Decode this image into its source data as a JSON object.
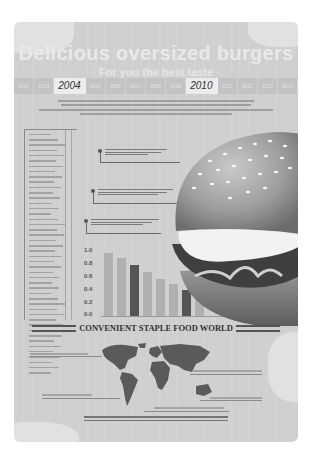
{
  "poster": {
    "title": "Delicious oversized burgers",
    "subtitle": "· For you the best taste ·",
    "timeline": {
      "years": [
        "2002",
        "2003",
        "2004",
        "2005",
        "2006",
        "2007",
        "2008",
        "2009",
        "2010",
        "2011",
        "2012",
        "2013",
        "2014"
      ],
      "highlighted": [
        "2004",
        "2010"
      ]
    },
    "intro_text": "Hamburger (Hamburger English transliteration), is a modern Western -style fast food in the world with the first vogue piece of fast food burger ...",
    "side_list_rows": 46,
    "callouts": [
      {
        "id": "callout-1",
        "text": "Hamburger caption text line"
      },
      {
        "id": "callout-2",
        "text": "Hamburger caption text line"
      },
      {
        "id": "callout-3",
        "text": "Hamburger caption text line"
      }
    ],
    "banner_title": "CONVENIENT STAPLE FOOD WORLD",
    "footer_text": "Hamburger (Hamburger English transliteration), is a modern Western -style fast food in the world with the first vogue piece of fast food burger ...",
    "colors": {
      "background": "#cfcfcf",
      "bar_light": "#b0b0b0",
      "bar_dark": "#555555",
      "banner_text": "#333333"
    }
  },
  "chart_data": {
    "type": "bar",
    "title": "",
    "xlabel": "",
    "ylabel": "",
    "ylim": [
      0.0,
      1.0
    ],
    "yticks": [
      "1.0",
      "0.8",
      "0.6",
      "0.4",
      "0.2",
      "0.0"
    ],
    "categories": [
      "1",
      "2",
      "3",
      "4",
      "5",
      "6",
      "7",
      "8"
    ],
    "values": [
      0.98,
      0.9,
      0.8,
      0.68,
      0.58,
      0.5,
      0.4,
      0.3
    ],
    "highlighted_indices": [
      2,
      6
    ],
    "grid": false,
    "legend": "none"
  }
}
